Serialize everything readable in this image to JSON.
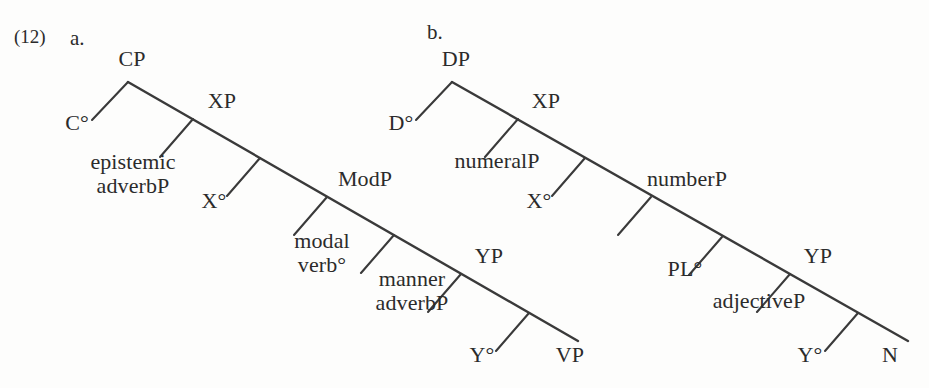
{
  "figure": {
    "example_number": "(12)",
    "line_color": "#3a3a3a",
    "background_color": "#fdfdfc",
    "text_color": "#2b2b2b"
  },
  "trees": [
    {
      "id": "a",
      "sub_label": "a.",
      "nodes": {
        "root": "CP",
        "head1": "C°",
        "spec1": "epistemic\nadverbP",
        "proj2": "XP",
        "head2": "X°",
        "spec2": "modal\nverb°",
        "proj3": "ModP",
        "head3": "Y°",
        "spec3": "manner\nadverbP",
        "proj4": "YP",
        "terminal": "VP"
      },
      "labels": {
        "cp": "CP",
        "c_head": "C°",
        "epistemic_adverbp_line1": "epistemic",
        "epistemic_adverbp_line2": "adverbP",
        "xp": "XP",
        "x_head": "X°",
        "modal_verb_line1": "modal",
        "modal_verb_line2": "verb°",
        "modp": "ModP",
        "manner_adverbp_line1": "manner",
        "manner_adverbp_line2": "adverbP",
        "yp": "YP",
        "y_head": "Y°",
        "vp": "VP"
      }
    },
    {
      "id": "b",
      "sub_label": "b.",
      "nodes": {
        "root": "DP",
        "head1": "D°",
        "spec1": "numeralP",
        "proj2": "XP",
        "head2": "X°",
        "spec2": "PL°",
        "proj3": "numberP",
        "head3": "Y°",
        "spec3": "adjectiveP",
        "proj4": "YP",
        "terminal": "N"
      },
      "labels": {
        "dp": "DP",
        "d_head": "D°",
        "numeralp": "numeralP",
        "xp": "XP",
        "x_head": "X°",
        "pl_head": "PL°",
        "numberp": "numberP",
        "adjectivep": "adjectiveP",
        "yp": "YP",
        "y_head": "Y°",
        "n": "N"
      }
    }
  ]
}
